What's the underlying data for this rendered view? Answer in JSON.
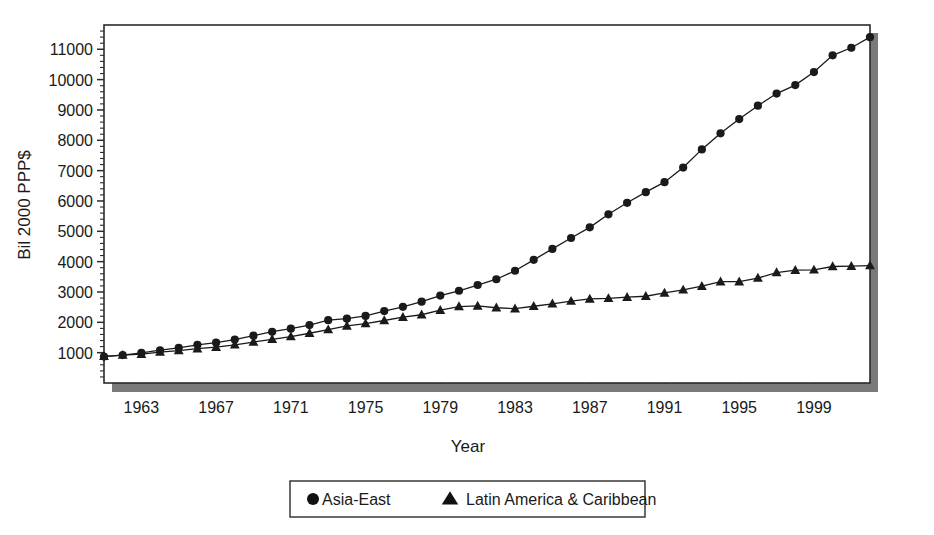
{
  "chart_data": {
    "type": "line",
    "title": "",
    "xlabel": "Year",
    "ylabel": "Bil 2000 PPP$",
    "xlim": [
      1961,
      2002
    ],
    "ylim": [
      0,
      11800
    ],
    "grid": false,
    "legend_position": "bottom",
    "x_tick_labels": [
      "1963",
      "1967",
      "1971",
      "1975",
      "1979",
      "1983",
      "1987",
      "1991",
      "1995",
      "1999"
    ],
    "x_ticks": [
      1963,
      1967,
      1971,
      1975,
      1979,
      1983,
      1987,
      1991,
      1995,
      1999
    ],
    "y_tick_labels": [
      "1000",
      "2000",
      "3000",
      "4000",
      "5000",
      "6000",
      "7000",
      "8000",
      "9000",
      "10000",
      "11000"
    ],
    "y_ticks": [
      1000,
      2000,
      3000,
      4000,
      5000,
      6000,
      7000,
      8000,
      9000,
      10000,
      11000
    ],
    "y_minor_tick_step": 200,
    "x": [
      1961,
      1962,
      1963,
      1964,
      1965,
      1966,
      1967,
      1968,
      1969,
      1970,
      1971,
      1972,
      1973,
      1974,
      1975,
      1976,
      1977,
      1978,
      1979,
      1980,
      1981,
      1982,
      1983,
      1984,
      1985,
      1986,
      1987,
      1988,
      1989,
      1990,
      1991,
      1992,
      1993,
      1994,
      1995,
      1996,
      1997,
      1998,
      1999,
      2000,
      2001,
      2002
    ],
    "series": [
      {
        "name": "Asia-East",
        "marker": "circle",
        "color": "#1a1a1a",
        "values": [
          870,
          920,
          990,
          1080,
          1160,
          1260,
          1330,
          1430,
          1560,
          1690,
          1790,
          1910,
          2070,
          2120,
          2210,
          2370,
          2510,
          2680,
          2880,
          3040,
          3230,
          3420,
          3700,
          4060,
          4420,
          4780,
          5130,
          5560,
          5940,
          6290,
          6620,
          7100,
          7700,
          8230,
          8700,
          9140,
          9540,
          9820,
          10250,
          10800,
          11050,
          11400
        ]
      },
      {
        "name": "Latin America & Caribbean",
        "marker": "triangle",
        "color": "#1a1a1a",
        "values": [
          880,
          920,
          950,
          1020,
          1070,
          1130,
          1180,
          1260,
          1350,
          1440,
          1530,
          1640,
          1760,
          1880,
          1960,
          2060,
          2170,
          2250,
          2400,
          2520,
          2540,
          2480,
          2450,
          2530,
          2610,
          2700,
          2770,
          2790,
          2830,
          2860,
          2970,
          3070,
          3190,
          3340,
          3340,
          3460,
          3640,
          3720,
          3730,
          3840,
          3850,
          3870
        ]
      }
    ]
  },
  "legend": {
    "items": [
      {
        "label": "Asia-East",
        "marker": "circle"
      },
      {
        "label": "Latin America & Caribbean",
        "marker": "triangle"
      }
    ]
  }
}
